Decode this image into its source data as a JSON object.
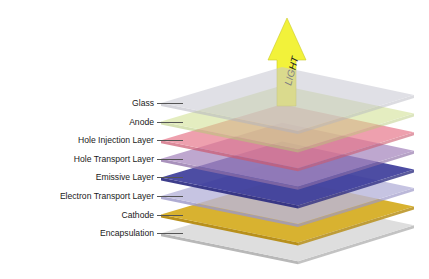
{
  "diagram": {
    "arrow": {
      "label": "LIGHT",
      "color": "#f2f23a",
      "stroke": "#c9c92a"
    },
    "layers": [
      {
        "name": "Glass",
        "fill": "#c8c8d2",
        "edge": "#b5b5c0",
        "opacity": 0.55
      },
      {
        "name": "Anode",
        "fill": "#cfe08e",
        "edge": "#b6c978",
        "opacity": 0.55
      },
      {
        "name": "Hole Injection Layer",
        "fill": "#e8788c",
        "edge": "#cc5a70",
        "opacity": 0.7
      },
      {
        "name": "Hole Transport Layer",
        "fill": "#a98ac0",
        "edge": "#8d6ea6",
        "opacity": 0.75
      },
      {
        "name": "Emissive Layer",
        "fill": "#3a3a9a",
        "edge": "#2a2a80",
        "opacity": 0.9
      },
      {
        "name": "Electron Transport Layer",
        "fill": "#b9b6dc",
        "edge": "#9c98c8",
        "opacity": 0.8
      },
      {
        "name": "Cathode",
        "fill": "#d8b230",
        "edge": "#b8901c",
        "opacity": 1
      },
      {
        "name": "Encapsulation",
        "fill": "#dedede",
        "edge": "#b8b8b8",
        "opacity": 1
      }
    ]
  }
}
